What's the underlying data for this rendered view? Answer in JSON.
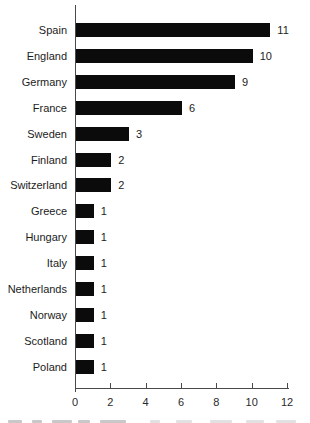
{
  "chart_data": {
    "type": "bar",
    "orientation": "horizontal",
    "title": "",
    "xlabel": "",
    "ylabel": "",
    "categories": [
      "Spain",
      "England",
      "Germany",
      "France",
      "Sweden",
      "Finland",
      "Switzerland",
      "Greece",
      "Hungary",
      "Italy",
      "Netherlands",
      "Norway",
      "Scotland",
      "Poland"
    ],
    "values": [
      11,
      10,
      9,
      6,
      3,
      2,
      2,
      1,
      1,
      1,
      1,
      1,
      1,
      1
    ],
    "value_labels": [
      "11",
      "10",
      "9",
      "6",
      "3",
      "2",
      "2",
      "1",
      "1",
      "1",
      "1",
      "1",
      "1",
      "1"
    ],
    "xlim": [
      0,
      12
    ],
    "x_ticks": [
      "0",
      "2",
      "4",
      "6",
      "8",
      "10",
      "12"
    ],
    "grid": false,
    "legend": false,
    "bar_color": "#0b0b0b",
    "axis_color": "#4a4a4a",
    "text_color": "#1c1c1c"
  }
}
